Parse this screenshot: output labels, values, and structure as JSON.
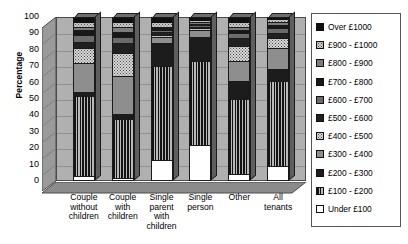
{
  "chart_data": {
    "type": "bar",
    "subtype": "stacked-column-3d",
    "title": "",
    "xlabel": "",
    "ylabel": "Percentage",
    "ylim": [
      0,
      100
    ],
    "yticks": [
      0,
      10,
      20,
      30,
      40,
      50,
      60,
      70,
      80,
      90,
      100
    ],
    "grid": true,
    "legend_position": "right",
    "categories": [
      "Couple without children",
      "Couple with children",
      "Single parent with children",
      "Single person",
      "Other",
      "All tenants"
    ],
    "series": [
      {
        "name": "Under £100",
        "values": [
          3,
          2,
          13,
          22,
          4,
          9
        ]
      },
      {
        "name": "£100 - £200",
        "values": [
          49,
          36,
          57,
          51,
          46,
          52
        ]
      },
      {
        "name": "£200 - £300",
        "values": [
          2,
          3,
          14,
          15,
          11,
          7
        ]
      },
      {
        "name": "£300 - £400",
        "values": [
          18,
          23,
          4,
          4,
          12,
          13
        ]
      },
      {
        "name": "£400 - £500",
        "values": [
          9,
          14,
          1,
          1,
          9,
          6
        ]
      },
      {
        "name": "£500 - £600",
        "values": [
          4,
          6,
          2,
          1,
          5,
          3
        ]
      },
      {
        "name": "£600 - £700",
        "values": [
          4,
          4,
          1,
          1,
          3,
          3
        ]
      },
      {
        "name": "£700 - £800",
        "values": [
          3,
          3,
          1,
          1,
          2,
          2
        ]
      },
      {
        "name": "£800 - £900",
        "values": [
          2,
          3,
          1,
          1,
          2,
          2
        ]
      },
      {
        "name": "£900 - £1000",
        "values": [
          3,
          3,
          3,
          1,
          3,
          2
        ]
      },
      {
        "name": "Over £1000",
        "values": [
          3,
          3,
          3,
          2,
          3,
          1
        ]
      }
    ]
  },
  "legend": {
    "items": [
      {
        "label": "Over £1000",
        "swatch": "solid-black"
      },
      {
        "label": "£900 - £1000",
        "swatch": "light-dotted"
      },
      {
        "label": "£800 - £900",
        "swatch": "mid-grey"
      },
      {
        "label": "£700 - £800",
        "swatch": "solid-black"
      },
      {
        "label": "£600 - £700",
        "swatch": "dark-grey"
      },
      {
        "label": "£500 - £600",
        "swatch": "solid-black"
      },
      {
        "label": "£400 - £500",
        "swatch": "checker"
      },
      {
        "label": "£300 - £400",
        "swatch": "mid-grey"
      },
      {
        "label": "£200 - £300",
        "swatch": "solid-black"
      },
      {
        "label": "£100 - £200",
        "swatch": "vertical-stripe"
      },
      {
        "label": "Under £100",
        "swatch": "white"
      }
    ]
  },
  "axes": {
    "y_title": "Percentage",
    "y_tick_labels": [
      "100",
      "90",
      "80",
      "70",
      "60",
      "50",
      "40",
      "30",
      "20",
      "10",
      "0"
    ],
    "x_tick_labels": [
      [
        "Couple",
        "without",
        "children"
      ],
      [
        "Couple",
        "with",
        "children"
      ],
      [
        "Single",
        "parent",
        "with",
        "children"
      ],
      [
        "Single",
        "person"
      ],
      [
        "Other"
      ],
      [
        "All",
        "tenants"
      ]
    ]
  },
  "colors": {
    "plot_background": "#b0b0b0",
    "gridline": "#8f8f8f",
    "axis_line": "#4a4a4a",
    "text": "#000000",
    "bar_outline": "#1a1a1a"
  }
}
